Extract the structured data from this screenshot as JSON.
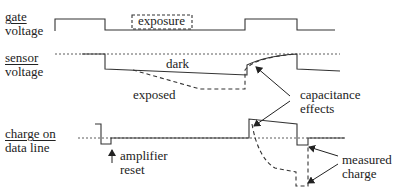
{
  "labels": {
    "gate": [
      "gate",
      "voltage"
    ],
    "sensor": [
      "sensor",
      "voltage"
    ],
    "charge": [
      "charge on",
      "data line"
    ]
  },
  "annotations": {
    "exposure": "exposure",
    "dark": "dark",
    "exposed": "exposed",
    "capacitance": [
      "capacitance",
      "effects"
    ],
    "amplifier": [
      "amplifier",
      "reset"
    ],
    "measured": [
      "measured",
      "charge"
    ]
  }
}
